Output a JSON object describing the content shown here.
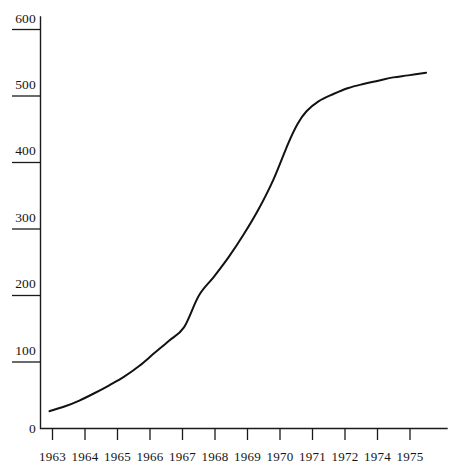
{
  "figure": {
    "background_color": "#ffffff",
    "ink_color": "#121212",
    "axis_color": "#1a1a1a"
  },
  "chart_data": {
    "type": "line",
    "title": "",
    "subtitle": "",
    "xlabel": "",
    "ylabel": "",
    "legend": [],
    "legend_position": "none",
    "grid": false,
    "xlim": [
      1962.7,
      1976.3
    ],
    "ylim": [
      0,
      600
    ],
    "x_tick_labels": [
      "1963",
      "1964",
      "1965",
      "1966",
      "1967",
      "1968",
      "1969",
      "1970",
      "1971",
      "1972",
      "1974",
      "1975"
    ],
    "x_tick_values": [
      1963,
      1964,
      1965,
      1966,
      1967,
      1968,
      1969,
      1970,
      1971,
      1972,
      1973,
      1974
    ],
    "y_tick_labels": [
      "0",
      "100",
      "200",
      "300",
      "400",
      "500",
      "600"
    ],
    "y_tick_values": [
      0,
      100,
      200,
      300,
      400,
      500,
      600
    ],
    "series": [
      {
        "name": "",
        "x": [
          1963.0,
          1963.5,
          1964.0,
          1964.5,
          1965.0,
          1965.5,
          1966.0,
          1966.5,
          1967.0,
          1967.5,
          1968.0,
          1968.5,
          1969.0,
          1969.5,
          1970.0,
          1970.5,
          1971.0,
          1971.3,
          1971.6,
          1972.0,
          1972.5,
          1973.0,
          1973.5,
          1974.0,
          1974.5,
          1975.0,
          1975.6
        ],
        "values": [
          26,
          33,
          42,
          53,
          65,
          78,
          94,
          113,
          132,
          152,
          200,
          228,
          258,
          292,
          330,
          375,
          430,
          458,
          477,
          492,
          503,
          512,
          518,
          523,
          528,
          531,
          535
        ]
      }
    ]
  }
}
